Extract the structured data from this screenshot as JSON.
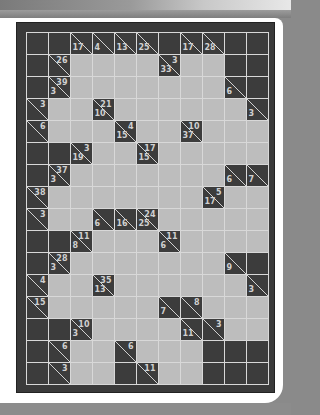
{
  "puzzle": {
    "type": "kakuro",
    "cols": 11,
    "rows": 16,
    "colors": {
      "block": "#3c3c3c",
      "entry": "#bdbdbd",
      "gridline": "#d8d8d8",
      "clue_text": "#d0d0d0",
      "frame": "#3a3a3a"
    },
    "legend": "Each cell: X = blocked, W = empty entry cell, clue cells have optional right (r) and down (d) sums",
    "grid": [
      [
        {
          "t": "X"
        },
        {
          "t": "X"
        },
        {
          "t": "C",
          "d": "17"
        },
        {
          "t": "C",
          "d": "4"
        },
        {
          "t": "C",
          "d": "13"
        },
        {
          "t": "C",
          "d": "25"
        },
        {
          "t": "X"
        },
        {
          "t": "C",
          "d": "17"
        },
        {
          "t": "C",
          "d": "28"
        },
        {
          "t": "X"
        },
        {
          "t": "X"
        }
      ],
      [
        {
          "t": "X"
        },
        {
          "t": "C",
          "r": "26"
        },
        {
          "t": "W"
        },
        {
          "t": "W"
        },
        {
          "t": "W"
        },
        {
          "t": "W"
        },
        {
          "t": "C",
          "r": "3",
          "d": "33"
        },
        {
          "t": "W"
        },
        {
          "t": "W"
        },
        {
          "t": "X"
        },
        {
          "t": "X"
        }
      ],
      [
        {
          "t": "X"
        },
        {
          "t": "C",
          "r": "39",
          "d": "3"
        },
        {
          "t": "W"
        },
        {
          "t": "W"
        },
        {
          "t": "W"
        },
        {
          "t": "W"
        },
        {
          "t": "W"
        },
        {
          "t": "W"
        },
        {
          "t": "W"
        },
        {
          "t": "C",
          "d": "6"
        },
        {
          "t": "X"
        }
      ],
      [
        {
          "t": "C",
          "r": "3"
        },
        {
          "t": "W"
        },
        {
          "t": "W"
        },
        {
          "t": "C",
          "r": "21",
          "d": "10"
        },
        {
          "t": "W"
        },
        {
          "t": "W"
        },
        {
          "t": "W"
        },
        {
          "t": "W"
        },
        {
          "t": "W"
        },
        {
          "t": "W"
        },
        {
          "t": "C",
          "d": "3"
        }
      ],
      [
        {
          "t": "C",
          "r": "6"
        },
        {
          "t": "W"
        },
        {
          "t": "W"
        },
        {
          "t": "W"
        },
        {
          "t": "C",
          "r": "4",
          "d": "15"
        },
        {
          "t": "W"
        },
        {
          "t": "W"
        },
        {
          "t": "C",
          "r": "10",
          "d": "37"
        },
        {
          "t": "W"
        },
        {
          "t": "W"
        },
        {
          "t": "W"
        }
      ],
      [
        {
          "t": "X"
        },
        {
          "t": "X"
        },
        {
          "t": "C",
          "r": "3",
          "d": "19"
        },
        {
          "t": "W"
        },
        {
          "t": "W"
        },
        {
          "t": "C",
          "r": "17",
          "d": "15"
        },
        {
          "t": "W"
        },
        {
          "t": "W"
        },
        {
          "t": "W"
        },
        {
          "t": "W"
        },
        {
          "t": "W"
        }
      ],
      [
        {
          "t": "X"
        },
        {
          "t": "C",
          "r": "37",
          "d": "3"
        },
        {
          "t": "W"
        },
        {
          "t": "W"
        },
        {
          "t": "W"
        },
        {
          "t": "W"
        },
        {
          "t": "W"
        },
        {
          "t": "W"
        },
        {
          "t": "W"
        },
        {
          "t": "C",
          "d": "6"
        },
        {
          "t": "C",
          "d": "7"
        }
      ],
      [
        {
          "t": "C",
          "r": "38"
        },
        {
          "t": "W"
        },
        {
          "t": "W"
        },
        {
          "t": "W"
        },
        {
          "t": "W"
        },
        {
          "t": "W"
        },
        {
          "t": "W"
        },
        {
          "t": "W"
        },
        {
          "t": "C",
          "r": "5",
          "d": "17"
        },
        {
          "t": "W"
        },
        {
          "t": "W"
        }
      ],
      [
        {
          "t": "C",
          "r": "3"
        },
        {
          "t": "W"
        },
        {
          "t": "W"
        },
        {
          "t": "C",
          "d": "6"
        },
        {
          "t": "C",
          "d": "16"
        },
        {
          "t": "C",
          "r": "24",
          "d": "25"
        },
        {
          "t": "W"
        },
        {
          "t": "W"
        },
        {
          "t": "W"
        },
        {
          "t": "W"
        },
        {
          "t": "W"
        }
      ],
      [
        {
          "t": "X"
        },
        {
          "t": "X"
        },
        {
          "t": "C",
          "r": "11",
          "d": "8"
        },
        {
          "t": "W"
        },
        {
          "t": "W"
        },
        {
          "t": "W"
        },
        {
          "t": "C",
          "r": "11",
          "d": "6"
        },
        {
          "t": "W"
        },
        {
          "t": "W"
        },
        {
          "t": "W"
        },
        {
          "t": "W"
        }
      ],
      [
        {
          "t": "X"
        },
        {
          "t": "C",
          "r": "28",
          "d": "3"
        },
        {
          "t": "W"
        },
        {
          "t": "W"
        },
        {
          "t": "W"
        },
        {
          "t": "W"
        },
        {
          "t": "W"
        },
        {
          "t": "W"
        },
        {
          "t": "W"
        },
        {
          "t": "C",
          "d": "9"
        },
        {
          "t": "X"
        }
      ],
      [
        {
          "t": "C",
          "r": "4"
        },
        {
          "t": "W"
        },
        {
          "t": "W"
        },
        {
          "t": "C",
          "r": "35",
          "d": "13"
        },
        {
          "t": "W"
        },
        {
          "t": "W"
        },
        {
          "t": "W"
        },
        {
          "t": "W"
        },
        {
          "t": "W"
        },
        {
          "t": "W"
        },
        {
          "t": "C",
          "d": "3"
        }
      ],
      [
        {
          "t": "C",
          "r": "15"
        },
        {
          "t": "W"
        },
        {
          "t": "W"
        },
        {
          "t": "W"
        },
        {
          "t": "W"
        },
        {
          "t": "W"
        },
        {
          "t": "C",
          "d": "7"
        },
        {
          "t": "C",
          "r": "8"
        },
        {
          "t": "W"
        },
        {
          "t": "W"
        },
        {
          "t": "W"
        }
      ],
      [
        {
          "t": "X"
        },
        {
          "t": "X"
        },
        {
          "t": "C",
          "r": "10",
          "d": "3"
        },
        {
          "t": "W"
        },
        {
          "t": "W"
        },
        {
          "t": "W"
        },
        {
          "t": "W"
        },
        {
          "t": "C",
          "d": "11"
        },
        {
          "t": "C",
          "r": "3"
        },
        {
          "t": "W"
        },
        {
          "t": "W"
        }
      ],
      [
        {
          "t": "X"
        },
        {
          "t": "C",
          "r": "6"
        },
        {
          "t": "W"
        },
        {
          "t": "W"
        },
        {
          "t": "C",
          "r": "6"
        },
        {
          "t": "W"
        },
        {
          "t": "W"
        },
        {
          "t": "W"
        },
        {
          "t": "X"
        },
        {
          "t": "X"
        },
        {
          "t": "X"
        }
      ],
      [
        {
          "t": "X"
        },
        {
          "t": "C",
          "r": "3"
        },
        {
          "t": "W"
        },
        {
          "t": "W"
        },
        {
          "t": "X"
        },
        {
          "t": "C",
          "r": "11"
        },
        {
          "t": "W"
        },
        {
          "t": "W"
        },
        {
          "t": "X"
        },
        {
          "t": "X"
        },
        {
          "t": "X"
        }
      ]
    ]
  }
}
